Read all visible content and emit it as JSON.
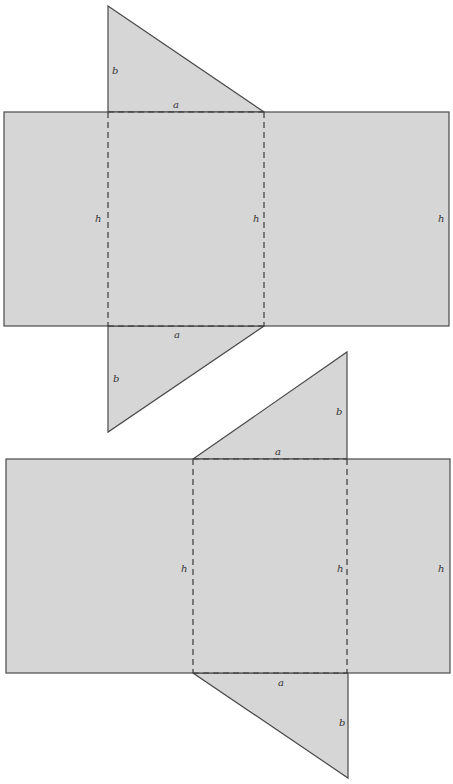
{
  "diagram": {
    "type": "triangular-prism-nets",
    "colors": {
      "face": "#d6d6d6",
      "edge": "#4a4a4a",
      "label": "#333333"
    },
    "nets": [
      {
        "id": "net-1",
        "labels": {
          "top_triangle_leg": "b",
          "top_fold": "a",
          "left_height": "h",
          "middle_height": "h",
          "right_height": "h",
          "bottom_fold": "a",
          "bottom_triangle_leg": "b"
        }
      },
      {
        "id": "net-2",
        "labels": {
          "top_triangle_leg": "b",
          "top_fold": "a",
          "left_height": "h",
          "middle_height": "h",
          "right_height": "h",
          "bottom_fold": "a",
          "bottom_triangle_leg": "b"
        }
      }
    ]
  }
}
